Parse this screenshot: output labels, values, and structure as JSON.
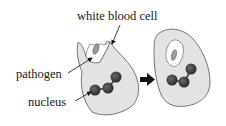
{
  "diagram": {
    "labels": {
      "white_blood_cell": "white blood cell",
      "pathogen": "pathogen",
      "nucleus": "nucleus"
    },
    "colors": {
      "cell_fill": "#e3e3e3",
      "cell_stroke": "#555555",
      "vacuole_fill": "#ffffff",
      "pathogen_fill": "#9a9a9a",
      "nucleus_fill": "#3a3a3a",
      "arrow": "#111111",
      "text": "#1a1a1a"
    },
    "stages": [
      {
        "name": "engulfing",
        "description": "white blood cell surrounding pathogen"
      },
      {
        "name": "engulfed",
        "description": "pathogen enclosed in vacuole"
      }
    ],
    "transition_arrow": "right-arrow"
  }
}
